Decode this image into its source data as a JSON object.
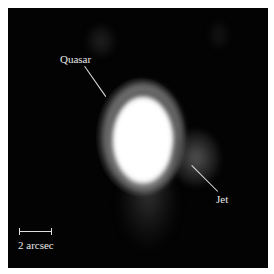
{
  "image": {
    "description": "Astronomical image of a quasar with a jet",
    "background_color": "#030303",
    "border_color": "#ffffff"
  },
  "labels": {
    "quasar": "Quasar",
    "jet": "Jet"
  },
  "scale_bar": {
    "label": "2 arcsec"
  }
}
